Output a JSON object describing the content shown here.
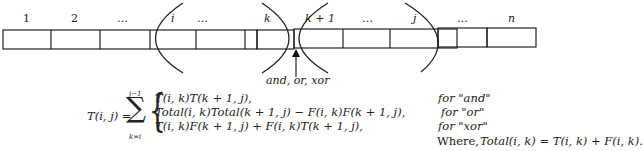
{
  "diagram": {
    "cell_labels": [
      "1",
      "2",
      "…",
      "i",
      "…",
      "k",
      "k + 1",
      "…",
      "j",
      "…",
      "n"
    ],
    "operator_label": "and, or, xor",
    "line_color": "#222222"
  },
  "formula": {
    "lhs": "T(i, j) =",
    "sum_upper": "j−1",
    "sum_lower": "k=i",
    "cases": [
      {
        "expr": "T(i, k)T(k + 1, j),",
        "condition": "for \"and\""
      },
      {
        "expr": "Total(i, k)Total(k + 1, j) − F(i, k)F(k + 1, j),",
        "condition": "for \"or\""
      },
      {
        "expr": "T(i, k)F(k + 1, j) + F(i, k)T(k + 1, j),",
        "condition": "for \"xor\""
      }
    ],
    "where_label": "Where,",
    "where_expr": "Total(i, k) = T(i, k) + F(i, k)."
  }
}
